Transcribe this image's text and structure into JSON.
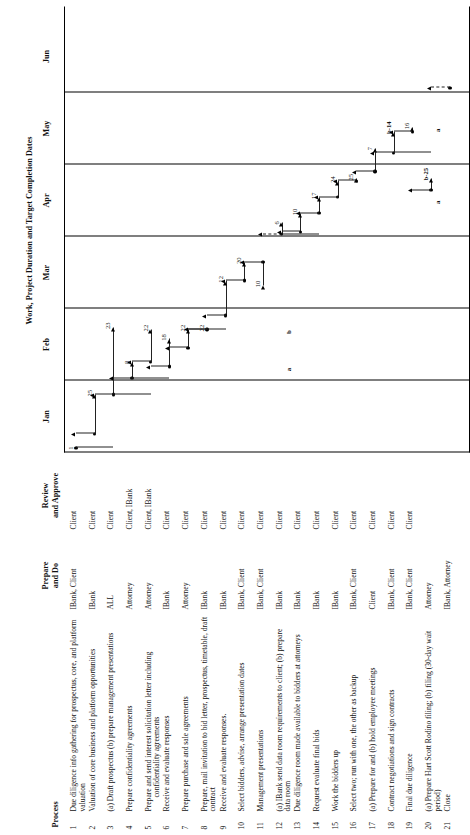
{
  "headers": {
    "process": "Process",
    "prepare": "Prepare\nand Do",
    "prepare_l1": "Prepare",
    "prepare_l2": "and Do",
    "review_l1": "Review",
    "review_l2": "and Approve",
    "timeline": "Work, Project Duration and Target Completion Dates"
  },
  "months": [
    {
      "label": "Jan"
    },
    {
      "label": "Feb"
    },
    {
      "label": "Mar"
    },
    {
      "label": "Apr"
    },
    {
      "label": "May"
    },
    {
      "label": "Jun"
    }
  ],
  "rows": [
    {
      "num": "1",
      "process": "Due diligence info gathering for prospectus, core, and platform valuation",
      "sub": "",
      "prepare": "IBank, Client",
      "review": "Client"
    },
    {
      "num": "2",
      "process": "Valuation of core business and platform opportunities",
      "sub": "",
      "prepare": "IBank",
      "review": "Client"
    },
    {
      "num": "3",
      "process": "(a) Draft prospectus (b) prepare management presentations",
      "sub": "",
      "prepare": "ALL",
      "review": "Client"
    },
    {
      "num": "4",
      "process": "Prepare confidentiality agreements",
      "sub": "",
      "prepare": "Attorney",
      "review": "Client, IBank"
    },
    {
      "num": "5",
      "process": "Prepare and send interest solicitation letter including",
      "sub": "confidentiality agreements",
      "prepare": "Attorney",
      "review": "Client, IBank"
    },
    {
      "num": "6",
      "process": "Receive and evaluate responses",
      "sub": "",
      "prepare": "IBank",
      "review": "Client"
    },
    {
      "num": "7",
      "process": "Prepare purchase and sale agreements",
      "sub": "",
      "prepare": "Attorney",
      "review": "Client"
    },
    {
      "num": "8",
      "process": "Prepare, mail invitation to bid letter, prospectus, timetable, draft contract",
      "sub": "",
      "prepare": "IBank",
      "review": "Client"
    },
    {
      "num": "9",
      "process": "Receive and evaluate responses.",
      "sub": "",
      "prepare": "IBank",
      "review": "Client"
    },
    {
      "num": "10",
      "process": "Select bidders, advise, arrange presentation dates",
      "sub": "",
      "prepare": "IBank, Client",
      "review": "Client"
    },
    {
      "num": "11",
      "process": "Management presentations",
      "sub": "",
      "prepare": "IBank, Client",
      "review": "Client"
    },
    {
      "num": "12",
      "process": "(a) IBank send data room requirements to client; (b) prepare data room",
      "sub": "",
      "prepare": "IBank",
      "review": "Client"
    },
    {
      "num": "13",
      "process": "Due diligence room made available to bidders at attorneys",
      "sub": "",
      "prepare": "IBank",
      "review": "Client"
    },
    {
      "num": "14",
      "process": "Request evaluate final bids",
      "sub": "",
      "prepare": "IBank",
      "review": "Client"
    },
    {
      "num": "15",
      "process": "Work the bidders up",
      "sub": "",
      "prepare": "IBank",
      "review": "Client"
    },
    {
      "num": "16",
      "process": "Select two; run with one, the other as backup",
      "sub": "",
      "prepare": "IBank, Client",
      "review": "Client"
    },
    {
      "num": "17",
      "process": "(a) Prepare for and (b) hold employee meetings",
      "sub": "",
      "prepare": "Client",
      "review": "Client"
    },
    {
      "num": "18",
      "process": "Contract negotiations and sign contracts",
      "sub": "",
      "prepare": "IBank, Client",
      "review": "Client"
    },
    {
      "num": "19",
      "process": "Final due diligence",
      "sub": "",
      "prepare": "IBank, Client",
      "review": "Client"
    },
    {
      "num": "20",
      "process": "(a) Prepare Hart Scott Rodino filing; (b) filing (30-day wait period)",
      "sub": "",
      "prepare": "Attorney",
      "review": ""
    },
    {
      "num": "21",
      "process": "Close",
      "sub": "",
      "prepare": "IBank, Attorney",
      "review": ""
    }
  ],
  "chart_data": {
    "type": "gantt",
    "title": "Work, Project Duration and Target Completion Dates",
    "xlabel": "",
    "ylabel": "",
    "categories": [
      "Jan",
      "Feb",
      "Mar",
      "Apr",
      "May",
      "Jun"
    ],
    "axis_range_months": [
      1,
      6
    ],
    "grid": "vertical month separators",
    "legend": "none",
    "tasks": [
      {
        "row": 1,
        "label": "1",
        "note": "start of project, Jan"
      },
      {
        "row": 2,
        "label": "25",
        "note": "Jan 25 target"
      },
      {
        "row": 3,
        "label": "23",
        "note": "Feb 23 target"
      },
      {
        "row": 4,
        "label": "8",
        "note": "Feb 8 target"
      },
      {
        "row": 5,
        "label": "8",
        "note": "Feb 8 target"
      },
      {
        "row": 5,
        "label": "22",
        "note": "Feb 22 target"
      },
      {
        "row": 6,
        "label": "18",
        "note": "Feb 18"
      },
      {
        "row": 7,
        "label": "22",
        "note": "Feb 22"
      },
      {
        "row": 8,
        "label": "22",
        "note": "Feb 22"
      },
      {
        "row": 9,
        "label": "12",
        "note": "Mar 12"
      },
      {
        "row": 10,
        "label": "20",
        "note": "Mar 20"
      },
      {
        "row": 11,
        "label": "10",
        "note": "Mar 10"
      },
      {
        "row": 12,
        "label": "6",
        "note": "Apr 6"
      },
      {
        "row": 13,
        "label": "10",
        "note": "Apr 10"
      },
      {
        "row": 14,
        "label": "17",
        "note": "Apr 17"
      },
      {
        "row": 15,
        "label": "24",
        "note": "Apr 24"
      },
      {
        "row": 16,
        "label": "25",
        "note": "Apr 25"
      },
      {
        "row": 17,
        "label": "7",
        "note": "May 7"
      },
      {
        "row": 18,
        "label": "b-14",
        "note": "May 14 (b)"
      },
      {
        "row": 19,
        "label": "16",
        "note": "May 16"
      },
      {
        "row": 20,
        "label": "b-25",
        "note": "Apr 25 (b)"
      },
      {
        "row": 20,
        "label": "a",
        "note": "(a) milestone"
      },
      {
        "row": 12,
        "label": "a",
        "note": "(a) milestone"
      },
      {
        "row": 12,
        "label": "b",
        "note": "(b) milestone"
      }
    ],
    "milestone_markers": [
      "a",
      "b",
      "a",
      "b",
      "b-14",
      "b-25",
      "16"
    ]
  }
}
